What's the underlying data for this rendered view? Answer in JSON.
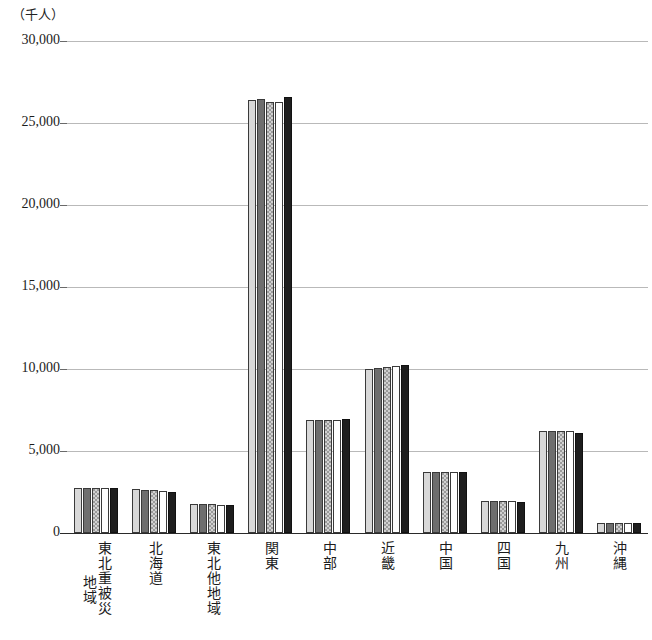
{
  "chart_data": {
    "type": "bar",
    "title": "",
    "subtitle": "",
    "xlabel": "",
    "ylabel": "（千人）",
    "unit_caption": "（千人）",
    "ylim": [
      0,
      30000
    ],
    "ytick_values": [
      30000,
      25000,
      20000,
      15000,
      10000,
      5000,
      0
    ],
    "ytick_labels": [
      "30,000",
      "25,000",
      "20,000",
      "15,000",
      "10,000",
      "5,000",
      "0"
    ],
    "grid": true,
    "grid_axis": "y",
    "legend": "none",
    "legend_position": "none",
    "annotations": [],
    "categories": [
      "東北重被災地域",
      "北海道",
      "東北他地域",
      "関東",
      "中部",
      "近畿",
      "中国",
      "四国",
      "九州",
      "沖縄"
    ],
    "categories_vertical": [
      {
        "primary": "東北重被災",
        "secondary": "地域"
      },
      {
        "primary": "北海道",
        "secondary": ""
      },
      {
        "primary": "東北他地域",
        "secondary": ""
      },
      {
        "primary": "関東",
        "secondary": ""
      },
      {
        "primary": "中部",
        "secondary": ""
      },
      {
        "primary": "近畿",
        "secondary": ""
      },
      {
        "primary": "中国",
        "secondary": ""
      },
      {
        "primary": "四国",
        "secondary": ""
      },
      {
        "primary": "九州",
        "secondary": ""
      },
      {
        "primary": "沖縄",
        "secondary": ""
      }
    ],
    "series": [
      {
        "name": "系列1",
        "color": "#d8d8d8",
        "pattern": "solid-light",
        "values": [
          2760,
          2700,
          1760,
          26400,
          6900,
          10000,
          3700,
          1960,
          6200,
          620
        ]
      },
      {
        "name": "系列2",
        "color": "#6e6e6e",
        "pattern": "solid-dark",
        "values": [
          2750,
          2650,
          1750,
          26450,
          6900,
          10050,
          3700,
          1950,
          6200,
          620
        ]
      },
      {
        "name": "系列3",
        "color": "#9a9a9a",
        "pattern": "hatched",
        "values": [
          2740,
          2600,
          1740,
          26300,
          6880,
          10150,
          3700,
          1940,
          6220,
          630
        ]
      },
      {
        "name": "系列4",
        "color": "#ffffff",
        "pattern": "white",
        "values": [
          2730,
          2560,
          1730,
          26300,
          6880,
          10200,
          3700,
          1930,
          6230,
          640
        ]
      },
      {
        "name": "系列5",
        "color": "#1e1e1e",
        "pattern": "solid-black",
        "values": [
          2720,
          2500,
          1730,
          26600,
          6950,
          10250,
          3720,
          1920,
          6100,
          640
        ]
      }
    ]
  }
}
